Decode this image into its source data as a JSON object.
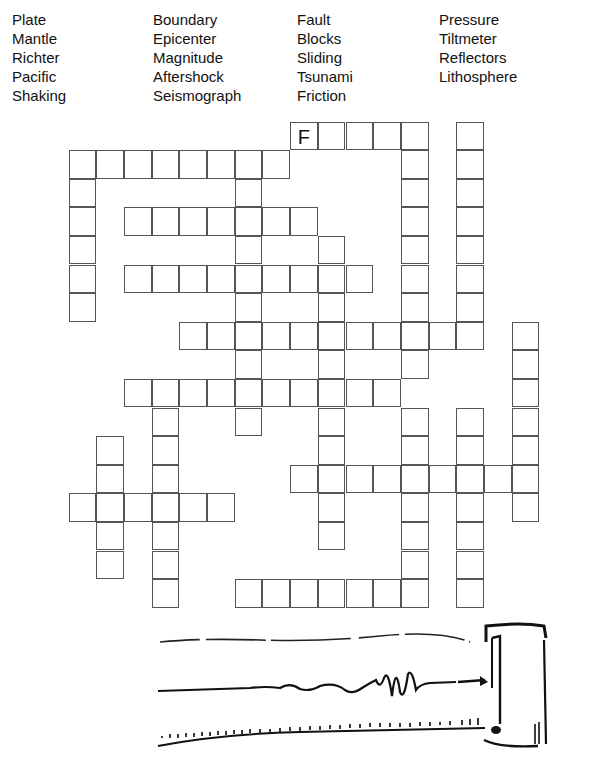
{
  "word_bank": {
    "columns": [
      {
        "x": 12,
        "words": [
          "Plate",
          "Mantle",
          "Richter",
          "Pacific",
          "Shaking"
        ]
      },
      {
        "x": 153,
        "words": [
          "Boundary",
          "Epicenter",
          "Magnitude",
          "Aftershock",
          "Seismograph"
        ]
      },
      {
        "x": 297,
        "words": [
          "Fault",
          "Blocks",
          "Sliding",
          "Tsunami",
          "Friction"
        ]
      },
      {
        "x": 439,
        "words": [
          "Pressure",
          "Tiltmeter",
          "Reflectors",
          "Lithosphere"
        ]
      }
    ]
  },
  "grid": {
    "cell_w": 27.7,
    "cell_h": 28.6,
    "rows": [
      [
        8,
        9,
        10,
        11,
        12,
        14
      ],
      [
        0,
        1,
        2,
        3,
        4,
        5,
        6,
        7,
        12,
        14
      ],
      [
        0,
        6,
        12,
        14
      ],
      [
        0,
        2,
        3,
        4,
        5,
        6,
        7,
        8,
        12,
        14
      ],
      [
        0,
        6,
        9,
        12,
        14
      ],
      [
        0,
        2,
        3,
        4,
        5,
        6,
        7,
        8,
        9,
        10,
        12,
        14
      ],
      [
        0,
        6,
        9,
        12,
        14
      ],
      [
        4,
        5,
        6,
        7,
        8,
        9,
        10,
        11,
        12,
        13,
        14,
        16
      ],
      [
        6,
        9,
        12,
        16
      ],
      [
        2,
        3,
        4,
        5,
        6,
        7,
        8,
        9,
        10,
        11,
        16
      ],
      [
        3,
        6,
        9,
        12,
        14,
        16
      ],
      [
        1,
        3,
        9,
        12,
        14,
        16
      ],
      [
        1,
        3,
        8,
        9,
        10,
        11,
        12,
        13,
        14,
        15,
        16
      ],
      [
        0,
        1,
        2,
        3,
        4,
        5,
        9,
        12,
        14,
        16
      ],
      [
        1,
        3,
        9,
        12,
        14
      ],
      [
        1,
        3,
        12,
        14
      ],
      [
        3,
        6,
        7,
        8,
        9,
        10,
        11,
        12,
        14
      ]
    ],
    "given_letters": [
      {
        "row": 0,
        "col": 8,
        "letter": "F"
      }
    ]
  },
  "illustration": {
    "name": "seismograph-drum-drawing",
    "trace_color": "#111111"
  }
}
